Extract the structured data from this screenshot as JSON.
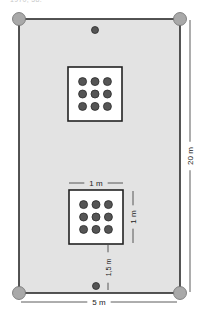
{
  "caption": "1970, 58.",
  "colors": {
    "field_fill": "#e3e3e3",
    "field_stroke": "#2b2b2b",
    "corner_fill": "#a9a9a9",
    "corner_stroke": "#6f6f6f",
    "dot_fill": "#555555",
    "dot_stroke": "#2b2b2b",
    "box_fill": "#ffffff",
    "box_stroke": "#222222",
    "dim_line": "#333333"
  },
  "field": {
    "x": 19,
    "y": 19,
    "width": 161,
    "height": 274
  },
  "corners": [
    {
      "cx": 19,
      "cy": 19,
      "r": 6.5
    },
    {
      "cx": 180,
      "cy": 19,
      "r": 6.5
    },
    {
      "cx": 19,
      "cy": 293,
      "r": 6.5
    },
    {
      "cx": 180,
      "cy": 293,
      "r": 6.5
    }
  ],
  "single_dots": [
    {
      "cx": 95,
      "cy": 30,
      "r": 3.5
    },
    {
      "cx": 96,
      "cy": 286,
      "r": 3.5
    }
  ],
  "plant_boxes": [
    {
      "name": "upper-plot",
      "x": 68,
      "y": 67,
      "size": 54,
      "rows": 3,
      "cols": 3,
      "dot_r": 4
    },
    {
      "name": "lower-plot",
      "x": 69,
      "y": 190,
      "size": 54,
      "rows": 3,
      "cols": 3,
      "dot_r": 4
    }
  ],
  "dimensions": {
    "width_total": {
      "label": "5 m",
      "y": 302,
      "x1": 21,
      "x2": 177
    },
    "height_total": {
      "label": "20 m",
      "x": 190,
      "y1": 20,
      "y2": 292
    },
    "box_width": {
      "label": "1 m",
      "y": 183,
      "x1": 69,
      "x2": 123
    },
    "box_height": {
      "label": "1 m",
      "x": 133,
      "y1": 191,
      "y2": 243
    },
    "box_offset": {
      "label": "1,5 m",
      "x": 108,
      "y1": 245,
      "y2": 290
    }
  }
}
